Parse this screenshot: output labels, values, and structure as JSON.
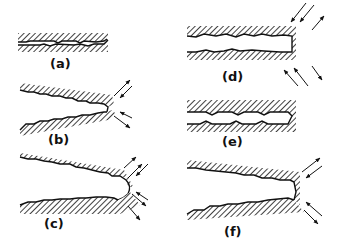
{
  "figure": {
    "panels": [
      {
        "id": "a",
        "label": "(a)",
        "description": "narrow crack with blunt tip, parallel faces"
      },
      {
        "id": "b",
        "label": "(b)",
        "description": "widening crack, tip opened under tension"
      },
      {
        "id": "c",
        "label": "(c)",
        "description": "blunted rounded crack tip under tension"
      },
      {
        "id": "d",
        "label": "(d)",
        "description": "crack closed under compression, square tip"
      },
      {
        "id": "e",
        "label": "(e)",
        "description": "crack re-sharpened, parallel faces"
      },
      {
        "id": "f",
        "label": "(f)",
        "description": "opened crack with new sharp tip"
      }
    ]
  },
  "colors": {
    "ink": "#111111",
    "background": "#ffffff"
  }
}
